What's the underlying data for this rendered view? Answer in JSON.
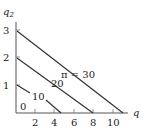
{
  "diagram": {
    "type": "isoprofit lines",
    "y_axis_label": "q2",
    "x_axis_label": "q",
    "origin_label": "0",
    "y_ticks": [
      "1",
      "2",
      "3"
    ],
    "x_ticks": [
      "2",
      "4",
      "6",
      "8",
      "10"
    ],
    "lines": [
      {
        "label": "10",
        "y_intercept": 1,
        "x_intercept": 4.7
      },
      {
        "label": "20",
        "y_intercept": 2,
        "x_intercept": 8
      },
      {
        "label": "π = 30",
        "y_intercept": 3,
        "x_intercept": 11
      }
    ],
    "colors": {
      "line": "#333333",
      "axis": "#555555",
      "text": "#222222"
    }
  }
}
